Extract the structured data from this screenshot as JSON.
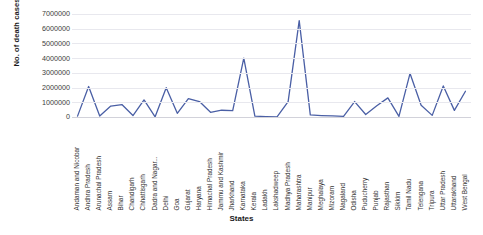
{
  "chart_data": {
    "type": "line",
    "title": "",
    "xlabel": "States",
    "ylabel": "No. of death cases",
    "ylim": [
      0,
      7000000
    ],
    "ytick_values": [
      7000000,
      6000000,
      5000000,
      4000000,
      3000000,
      2000000,
      1000000,
      0
    ],
    "ytick_labels": [
      "7000000",
      "6000000",
      "5000000",
      "4000000",
      "3000000",
      "2000000",
      "1000000",
      "0"
    ],
    "grid": true,
    "legend": "none",
    "line_color": "#4a5fa5",
    "categories": [
      "Andaman and Nicobar",
      "Andhra Pradesh",
      "Arunachal Pradesh",
      "Assam",
      "Bihar",
      "Chandigarh",
      "Chhattisgarh",
      "Dadra and Nagar...",
      "Delhi",
      "Goa",
      "Gujarat",
      "Haryana",
      "Himachal Pradesh",
      "Jammu and Kashmir",
      "Jharkhand",
      "Karnataka",
      "Kerala",
      "Ladakh",
      "Lakshadweep",
      "Madhya Pradesh",
      "Maharashtra",
      "Manipur",
      "Meghalaya",
      "Mizoram",
      "Nagaland",
      "Odisha",
      "Puducherry",
      "Punjab",
      "Rajasthan",
      "Sikkim",
      "Tamil Nadu",
      "Telengana",
      "Tripura",
      "Uttar Pradesh",
      "Uttarakhand",
      "West Bengal"
    ],
    "values": [
      60000,
      2070000,
      65000,
      745000,
      845000,
      100000,
      1160000,
      11000,
      1990000,
      250000,
      1250000,
      1050000,
      320000,
      460000,
      440000,
      4000000,
      60000,
      30000,
      12000,
      1050000,
      6550000,
      140000,
      100000,
      75000,
      40000,
      1050000,
      170000,
      760000,
      1300000,
      45000,
      2960000,
      800000,
      110000,
      2110000,
      450000,
      1750000
    ],
    "series_name": "No. of death cases"
  }
}
